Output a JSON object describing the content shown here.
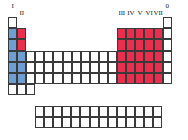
{
  "figure": {
    "name": "periodic-table-group-block-diagram",
    "colors": {
      "s_block_group1": "#6f9fd2",
      "s_block_group2": "#ea2f4e",
      "p_block": "#ea2f4e",
      "cell_border": "#3a3a3a",
      "background": "#ffffff",
      "label_text": "#1a1a1a"
    }
  },
  "group_labels": {
    "left": [
      {
        "id": "group-I",
        "text": "I",
        "column": 1
      },
      {
        "id": "group-II",
        "text": "II",
        "column": 2
      }
    ],
    "right": [
      {
        "id": "group-III",
        "text": "III",
        "column": 13
      },
      {
        "id": "group-IV",
        "text": "IV",
        "column": 14
      },
      {
        "id": "group-V",
        "text": "V",
        "column": 15
      },
      {
        "id": "group-VI",
        "text": "VI",
        "column": 16
      },
      {
        "id": "group-VII",
        "text": "VII",
        "column": 17
      },
      {
        "id": "group-0",
        "text": "0",
        "column": 18
      }
    ]
  },
  "main_grid": {
    "columns": 18,
    "rows": 7,
    "cells": [
      [
        "white",
        "empty",
        "empty",
        "empty",
        "empty",
        "empty",
        "empty",
        "empty",
        "empty",
        "empty",
        "empty",
        "empty",
        "empty",
        "empty",
        "empty",
        "empty",
        "empty",
        "white"
      ],
      [
        "blue",
        "red",
        "empty",
        "empty",
        "empty",
        "empty",
        "empty",
        "empty",
        "empty",
        "empty",
        "empty",
        "empty",
        "red",
        "red",
        "red",
        "red",
        "red",
        "white"
      ],
      [
        "blue",
        "red",
        "empty",
        "empty",
        "empty",
        "empty",
        "empty",
        "empty",
        "empty",
        "empty",
        "empty",
        "empty",
        "red",
        "red",
        "red",
        "red",
        "red",
        "white"
      ],
      [
        "blue",
        "blue",
        "white",
        "white",
        "white",
        "white",
        "white",
        "white",
        "white",
        "white",
        "white",
        "white",
        "red",
        "red",
        "red",
        "red",
        "red",
        "white"
      ],
      [
        "blue",
        "blue",
        "white",
        "white",
        "white",
        "white",
        "white",
        "white",
        "white",
        "white",
        "white",
        "white",
        "red",
        "red",
        "red",
        "red",
        "red",
        "white"
      ],
      [
        "blue",
        "blue",
        "white",
        "white",
        "white",
        "white",
        "white",
        "white",
        "white",
        "white",
        "white",
        "white",
        "red",
        "red",
        "red",
        "red",
        "red",
        "white"
      ],
      [
        "white",
        "white",
        "white",
        "empty",
        "empty",
        "empty",
        "empty",
        "empty",
        "empty",
        "empty",
        "empty",
        "empty",
        "empty",
        "empty",
        "empty",
        "empty",
        "empty",
        "empty"
      ]
    ]
  },
  "f_block_grid": {
    "columns": 14,
    "rows": 2,
    "cells": [
      [
        "white",
        "white",
        "white",
        "white",
        "white",
        "white",
        "white",
        "white",
        "white",
        "white",
        "white",
        "white",
        "white",
        "white"
      ],
      [
        "white",
        "white",
        "white",
        "white",
        "white",
        "white",
        "white",
        "white",
        "white",
        "white",
        "white",
        "white",
        "white",
        "white"
      ]
    ]
  }
}
